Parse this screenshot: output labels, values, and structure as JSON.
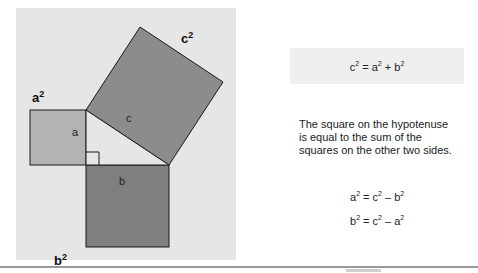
{
  "diagram": {
    "labels": {
      "c_square": "c",
      "a_square": "a",
      "b_square": "b",
      "side_a": "a",
      "side_b": "b",
      "side_c": "c",
      "exponent": "2"
    },
    "colors": {
      "panel": "#e6e6e6",
      "square_a": "#b3b3b3",
      "square_b": "#7f7f7f",
      "square_c": "#8c8c8c",
      "triangle": "#e6e6e6",
      "stroke": "#1a1a1a"
    }
  },
  "formula": {
    "main": {
      "lhs": "c",
      "eq": " = ",
      "t1": "a",
      "plus": " + ",
      "t2": "b",
      "exp": "2"
    }
  },
  "caption": "The square on the hypotenuse is equal to the sum of the squares on the other two sides.",
  "equations": [
    {
      "lhs": "a",
      "eq": " = ",
      "t1": "c",
      "minus": " – ",
      "t2": "b",
      "exp": "2"
    },
    {
      "lhs": "b",
      "eq": " = ",
      "t1": "c",
      "minus": " – ",
      "t2": "a",
      "exp": "2"
    }
  ]
}
